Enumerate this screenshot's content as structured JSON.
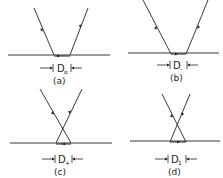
{
  "diagram": {
    "panels": [
      {
        "id": "a",
        "caption": "(a)",
        "label": "D",
        "subscript": "o",
        "type": "separated-beams"
      },
      {
        "id": "b",
        "caption": "(b)",
        "label": "D",
        "subscript": "-",
        "type": "separated-beams-narrow"
      },
      {
        "id": "c",
        "caption": "(c)",
        "label": "D",
        "subscript": "+",
        "type": "crossed-beams"
      },
      {
        "id": "d",
        "caption": "(d)",
        "label": "D",
        "subscript": "1",
        "type": "crossed-beams-narrow"
      }
    ],
    "colors": {
      "line": "#222222",
      "background": "#ffffff"
    }
  }
}
